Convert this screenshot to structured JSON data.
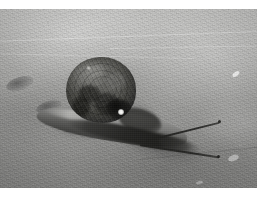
{
  "image": {
    "kind": "photograph",
    "palette": "grayscale",
    "orientation": "landscape",
    "width": 266,
    "height": 197,
    "border": {
      "color": "#ffffff",
      "top_px": 9,
      "right_px": 9,
      "bottom_px": 9,
      "left_px": 0
    },
    "caption": "Black and white photograph of a snail crawling on a concrete surface",
    "alt_text": "A dark-shelled garden snail seen from the side on rough grey concrete, its foot stretched out to the left and two long tentacles extended toward the right.",
    "subject": {
      "name": "snail",
      "parts": [
        {
          "label": "shell",
          "description": "dark mottled rounded spiral shell",
          "tone": "#44443f"
        },
        {
          "label": "body-foot",
          "description": "pale grey muscular foot stretched along the ground",
          "tone": "#8a8a88"
        },
        {
          "label": "tentacle-upper",
          "description": "long upper eye stalk pointing up-right",
          "tone": "#22221f"
        },
        {
          "label": "tentacle-lower",
          "description": "long lower eye stalk pointing down-right",
          "tone": "#22221f"
        },
        {
          "label": "tail",
          "description": "tapering rear of the foot",
          "tone": "#3a3a38"
        }
      ]
    },
    "background": {
      "label": "concrete-ground",
      "description": "coarse grey concrete, brighter toward the top of the frame, darker in the foreground",
      "tone_top": "#c3c3c1",
      "tone_bottom": "#868684",
      "features": [
        {
          "label": "ground-mark-left-upper",
          "description": "small dark elliptical pit"
        },
        {
          "label": "ground-mark-left-lower",
          "description": "small dark elliptical pit"
        },
        {
          "label": "bright-chip-right",
          "description": "small white flake of aggregate"
        },
        {
          "label": "seam-line",
          "description": "faint pale diagonal seam across the upper ground"
        }
      ]
    },
    "lighting": {
      "description": "soft diffuse daylight from the upper left casting a shadow down-left of the snail",
      "shadow_direction": "lower-left",
      "specular_highlight": "small white glint on the lower right of the shell"
    }
  }
}
